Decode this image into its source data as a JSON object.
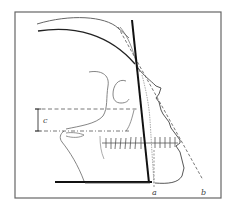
{
  "figure": {
    "labels": {
      "a": "a",
      "b": "b",
      "c": "c"
    },
    "colors": {
      "frame": "#555555",
      "thick_line": "#111111",
      "outline": "#666666",
      "dashed": "#555555",
      "background": "#ffffff"
    }
  }
}
